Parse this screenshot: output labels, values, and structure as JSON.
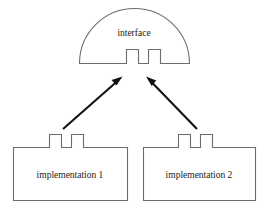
{
  "diagram": {
    "type": "interface-implementation-diagram",
    "background_color": "#ffffff",
    "stroke_color": "#6d6d6d",
    "arrow_color": "#111111",
    "text_color": "#1a1a1a",
    "nodes": {
      "interface": {
        "label": "interface",
        "shape": "semicircle-with-two-notches",
        "label_x": 134,
        "label_y": 36
      },
      "implementation_left": {
        "label": "implementation 1",
        "shape": "rectangle-with-two-tabs",
        "label_x": 70,
        "label_y": 178
      },
      "implementation_right": {
        "label": "implementation 2",
        "shape": "rectangle-with-two-tabs",
        "label_x": 199,
        "label_y": 178
      }
    },
    "edges": [
      {
        "name": "arrow-left-implementation-to-interface",
        "from": "implementation_left",
        "to": "interface",
        "direction": "up-right",
        "arrowhead": "end"
      },
      {
        "name": "arrow-right-implementation-to-interface",
        "from": "implementation_right",
        "to": "interface",
        "direction": "up-left",
        "arrowhead": "end"
      }
    ]
  }
}
